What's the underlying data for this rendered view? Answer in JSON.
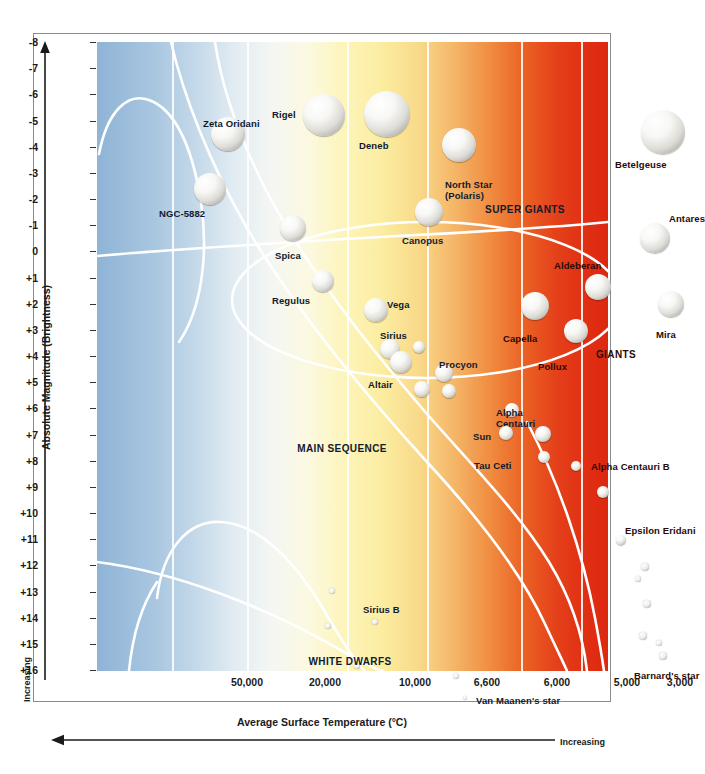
{
  "chart_data": {
    "type": "scatter",
    "xlabel": "Average Surface Temperature (°C)",
    "ylabel": "Absolute Magnitude (Brightness)",
    "x_increasing_label": "Increasing",
    "y_increasing_label": "Increasing",
    "xticks": [
      "50,000",
      "20,000",
      "10,000",
      "6,600",
      "6,000",
      "5,000",
      "3,000"
    ],
    "xtick_px": [
      150,
      228,
      318,
      390,
      460,
      530,
      583
    ],
    "xlim_note": "temperature decreasing left to right (reversed axis)",
    "yticks": [
      "-8",
      "-7",
      "-6",
      "-5",
      "-4",
      "-3",
      "-2",
      "-1",
      "0",
      "+1",
      "+2",
      "+3",
      "+4",
      "+5",
      "+6",
      "+7",
      "+8",
      "+9",
      "+10",
      "+11",
      "+12",
      "+13",
      "+14",
      "+15",
      "+16"
    ],
    "ylim": [
      -8,
      16
    ],
    "grid": "vertical white bands",
    "legend_position": "none",
    "annotations": [
      {
        "text": "SUPER GIANTS",
        "x_px": 428,
        "y_px": 162,
        "color": "dark-navy"
      },
      {
        "text": "GIANTS",
        "x_px": 519,
        "y_px": 307,
        "color": "dark-red"
      },
      {
        "text": "MAIN SEQUENCE",
        "x_px": 245,
        "y_px": 401,
        "color": "dark-navy"
      },
      {
        "text": "WHITE DWARFS",
        "x_px": 253,
        "y_px": 614,
        "color": "dark-navy"
      }
    ],
    "stars": [
      {
        "name": "Zeta Oridani",
        "magnitude": -5.7,
        "label_x": 106,
        "label_y": 77,
        "x_px": 131,
        "y_px": 92,
        "r": 17,
        "align": "left",
        "tone": "navy"
      },
      {
        "name": "Rigel",
        "magnitude": -7.1,
        "label_x": 175,
        "label_y": 68,
        "x_px": 227,
        "y_px": 73,
        "r": 21,
        "align": "left",
        "tone": "navy"
      },
      {
        "name": "Deneb",
        "magnitude": -6.5,
        "label_x": 262,
        "label_y": 99,
        "x_px": 290,
        "y_px": 72,
        "r": 23,
        "align": "left",
        "tone": "navy"
      },
      {
        "name": "NGC-5882",
        "magnitude": -4.0,
        "label_x": 62,
        "label_y": 167,
        "x_px": 113,
        "y_px": 147,
        "r": 16,
        "align": "left",
        "tone": "navy"
      },
      {
        "name": "North Star\n(Polaris)",
        "magnitude": -4.8,
        "label_x": 348,
        "label_y": 138,
        "x_px": 362,
        "y_px": 103,
        "r": 17,
        "align": "left",
        "tone": "navy"
      },
      {
        "name": "Betelgeuse",
        "magnitude": -6.3,
        "label_x": 518,
        "label_y": 118,
        "x_px": 566,
        "y_px": 90,
        "r": 22,
        "align": "left",
        "tone": "dark"
      },
      {
        "name": "Antares",
        "magnitude": -3.2,
        "label_x": 572,
        "label_y": 172,
        "x_px": 558,
        "y_px": 196,
        "r": 15,
        "align": "left",
        "tone": "dark"
      },
      {
        "name": "Spica",
        "magnitude": -2.6,
        "label_x": 178,
        "label_y": 209,
        "x_px": 196,
        "y_px": 186,
        "r": 13,
        "align": "left",
        "tone": "navy"
      },
      {
        "name": "Canopus",
        "magnitude": -2.9,
        "label_x": 305,
        "label_y": 194,
        "x_px": 332,
        "y_px": 170,
        "r": 14,
        "align": "left",
        "tone": "navy"
      },
      {
        "name": "Aldeberan",
        "magnitude": -0.7,
        "label_x": 457,
        "label_y": 219,
        "x_px": 501,
        "y_px": 245,
        "r": 13,
        "align": "left",
        "tone": "dark"
      },
      {
        "name": "Regulus",
        "magnitude": -0.6,
        "label_x": 175,
        "label_y": 254,
        "x_px": 226,
        "y_px": 239,
        "r": 11,
        "align": "left",
        "tone": "navy"
      },
      {
        "name": "Vega",
        "magnitude": 0.5,
        "label_x": 290,
        "label_y": 258,
        "x_px": 279,
        "y_px": 268,
        "r": 12,
        "align": "left",
        "tone": "navy"
      },
      {
        "name": "Capella",
        "magnitude": 0.0,
        "label_x": 406,
        "label_y": 292,
        "x_px": 438,
        "y_px": 264,
        "r": 14,
        "align": "left",
        "tone": "dark"
      },
      {
        "name": "Mira",
        "magnitude": 0.0,
        "label_x": 559,
        "label_y": 288,
        "x_px": 574,
        "y_px": 262,
        "r": 13,
        "align": "left",
        "tone": "dark"
      },
      {
        "name": "Pollux",
        "magnitude": 1.0,
        "label_x": 441,
        "label_y": 320,
        "x_px": 479,
        "y_px": 289,
        "r": 12,
        "align": "left",
        "tone": "dark"
      },
      {
        "name": "Sirius",
        "magnitude": 1.5,
        "label_x": 283,
        "label_y": 289,
        "x_px": 293,
        "y_px": 307,
        "r": 10,
        "align": "left",
        "tone": "navy"
      },
      {
        "name": "Altair",
        "magnitude": 2.3,
        "label_x": 271,
        "label_y": 338,
        "x_px": 304,
        "y_px": 320,
        "r": 11,
        "align": "left",
        "tone": "navy"
      },
      {
        "name": "Procyon",
        "magnitude": 2.7,
        "label_x": 342,
        "label_y": 318,
        "x_px": 347,
        "y_px": 331,
        "r": 9,
        "align": "left",
        "tone": "navy"
      },
      {
        "name": "Alpha\nCentauri",
        "magnitude": 4.2,
        "label_x": 399,
        "label_y": 366,
        "x_px": 415,
        "y_px": 368,
        "r": 7,
        "align": "left",
        "tone": "navy"
      },
      {
        "name": "Sun",
        "magnitude": 4.8,
        "label_x": 376,
        "label_y": 390,
        "x_px": 409,
        "y_px": 391,
        "r": 7,
        "align": "left",
        "tone": "navy"
      },
      {
        "name": "Tau Ceti",
        "magnitude": 5.7,
        "label_x": 377,
        "label_y": 419,
        "x_px": 447,
        "y_px": 415,
        "r": 6,
        "align": "left",
        "tone": "navy"
      },
      {
        "name": "Alpha Centauri B",
        "magnitude": 5.9,
        "label_x": 494,
        "label_y": 420,
        "x_px": 479,
        "y_px": 424,
        "r": 5,
        "align": "left",
        "tone": "dark"
      },
      {
        "name": "Epsilon Eridani",
        "magnitude": 8.9,
        "label_x": 528,
        "label_y": 484,
        "x_px": 524,
        "y_px": 498,
        "r": 5,
        "align": "left",
        "tone": "dark"
      },
      {
        "name": "Barnard's star",
        "magnitude": 14.2,
        "label_x": 537,
        "label_y": 629,
        "x_px": 566,
        "y_px": 614,
        "r": 4,
        "align": "left",
        "tone": "dark"
      },
      {
        "name": "Sirius B",
        "magnitude": 11.8,
        "label_x": 266,
        "label_y": 563,
        "x_px": 278,
        "y_px": 580,
        "r": 3,
        "align": "left",
        "tone": "navy"
      },
      {
        "name": "Van Maanen's star",
        "magnitude": 15.2,
        "label_x": 379,
        "label_y": 654,
        "x_px": 368,
        "y_px": 656,
        "r": 2,
        "align": "left",
        "tone": "navy"
      }
    ],
    "unlabeled_stars": [
      {
        "x_px": 322,
        "y_px": 305,
        "r": 6
      },
      {
        "x_px": 325,
        "y_px": 347,
        "r": 8
      },
      {
        "x_px": 352,
        "y_px": 349,
        "r": 7
      },
      {
        "x_px": 446,
        "y_px": 392,
        "r": 8
      },
      {
        "x_px": 506,
        "y_px": 450,
        "r": 6
      },
      {
        "x_px": 548,
        "y_px": 525,
        "r": 4
      },
      {
        "x_px": 541,
        "y_px": 537,
        "r": 3
      },
      {
        "x_px": 550,
        "y_px": 562,
        "r": 4
      },
      {
        "x_px": 546,
        "y_px": 594,
        "r": 4
      },
      {
        "x_px": 562,
        "y_px": 601,
        "r": 3
      },
      {
        "x_px": 235,
        "y_px": 549,
        "r": 3
      },
      {
        "x_px": 231,
        "y_px": 584,
        "r": 3
      },
      {
        "x_px": 260,
        "y_px": 624,
        "r": 3
      },
      {
        "x_px": 359,
        "y_px": 634,
        "r": 3
      }
    ]
  },
  "axes": {
    "y_title": "Absolute Magnitude (Brightness)",
    "x_title": "Average Surface Temperature (°C)",
    "y_increasing": "Increasing",
    "x_increasing": "Increasing"
  }
}
